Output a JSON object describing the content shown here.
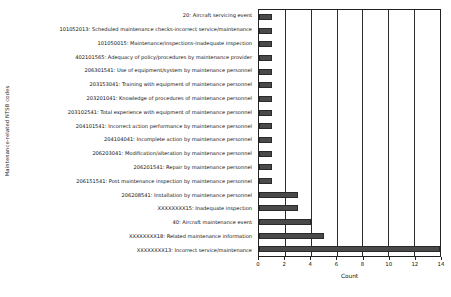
{
  "chart_data": {
    "type": "bar",
    "orientation": "horizontal",
    "title": "",
    "xlabel": "Count",
    "ylabel": "Maintenance-related NTSB codes",
    "xlim": [
      0,
      14
    ],
    "xticks": [
      0,
      2,
      4,
      6,
      8,
      10,
      12,
      14
    ],
    "grid": true,
    "grid_axis": "x",
    "legend": false,
    "bar_color": "#4a4a4a",
    "categories": [
      "20: Aircraft servicing event",
      "101052013: Scheduled maintenance checks-incorrect service/maintenance",
      "101050015: Maintenance/inspections-inadequate inspection",
      "402101565: Adequacy of policy/procedures by maintenance provider",
      "206301541: Use of equipment/system by maintenance personnel",
      "203153041: Training with equipment of maintenance personnel",
      "203201041: Knowledge of procedures of maintenance personnel",
      "203102541: Total experience with equipment of maintenance personnel",
      "204101541: Incorrect action performance by maintenance personnel",
      "204104041: Incomplete action by maintenance personnel",
      "206203041: Modification/alteration by maintenance personnel",
      "206201541: Repair by maintenance personnel",
      "206151541: Post maintenance inspection by maintenance personnel",
      "206208541: Installation by maintenance personnel",
      "XXXXXXXX15: Inadequate inspection",
      "40: Aircraft maintenance event",
      "XXXXXXXX18: Related maintenance information",
      "XXXXXXXX13: Incorrect service/maintenance"
    ],
    "values": [
      1,
      1,
      1,
      1,
      1,
      1,
      1,
      1,
      1,
      1,
      1,
      1,
      1,
      3,
      3,
      4,
      5,
      14
    ]
  }
}
